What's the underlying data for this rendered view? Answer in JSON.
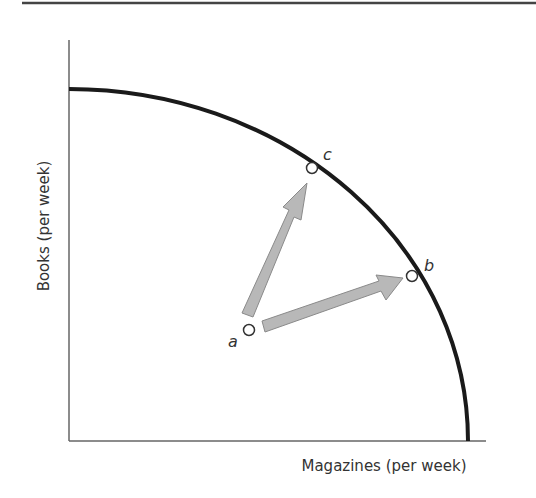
{
  "diagram": {
    "type": "production-possibilities-frontier",
    "x_axis_label": "Magazines (per week)",
    "y_axis_label": "Books (per week)",
    "points": [
      {
        "id": "a",
        "label": "a",
        "description": "inside the frontier"
      },
      {
        "id": "b",
        "label": "b",
        "description": "on the frontier"
      },
      {
        "id": "c",
        "label": "c",
        "description": "on the frontier"
      }
    ],
    "arrows": [
      {
        "from": "a",
        "to": "c"
      },
      {
        "from": "a",
        "to": "b"
      }
    ],
    "colors": {
      "curve": "#1a1a1a",
      "axis": "#666666",
      "arrow_fill": "#b8b8b8",
      "arrow_stroke": "#8a8a8a",
      "top_rule": "#444444",
      "text": "#333333"
    }
  }
}
